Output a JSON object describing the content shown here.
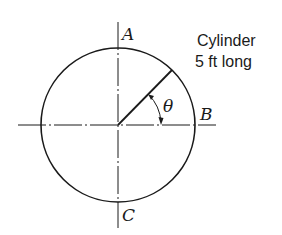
{
  "diagram": {
    "type": "cylinder cross-section",
    "labels": {
      "top": "A",
      "right": "B",
      "bottom": "C",
      "angle": "θ"
    },
    "note": {
      "line1": "Cylinder",
      "line2": "5 ft long"
    },
    "colors": {
      "stroke": "#1a1a1a",
      "background": "#ffffff"
    }
  }
}
